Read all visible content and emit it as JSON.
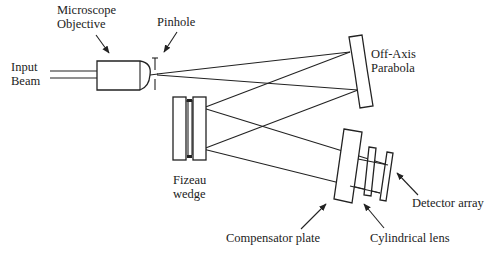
{
  "diagram": {
    "type": "optical-schematic",
    "labels": {
      "input_beam": [
        "Input",
        "Beam"
      ],
      "microscope_objective": [
        "Microscope",
        "Objective"
      ],
      "pinhole": "Pinhole",
      "off_axis_parabola": [
        "Off-Axis",
        "Parabola"
      ],
      "fizeau_wedge": [
        "Fizeau",
        "wedge"
      ],
      "compensator_plate": "Compensator plate",
      "cylindrical_lens": "Cylindrical lens",
      "detector_array": "Detector array"
    },
    "components": [
      {
        "id": "input-beam",
        "name": "Input Beam"
      },
      {
        "id": "microscope-objective",
        "name": "Microscope Objective"
      },
      {
        "id": "pinhole",
        "name": "Pinhole"
      },
      {
        "id": "off-axis-parabola",
        "name": "Off-Axis Parabola"
      },
      {
        "id": "fizeau-wedge",
        "name": "Fizeau wedge"
      },
      {
        "id": "compensator-plate",
        "name": "Compensator plate"
      },
      {
        "id": "cylindrical-lens",
        "name": "Cylindrical lens"
      },
      {
        "id": "detector-array",
        "name": "Detector array"
      }
    ],
    "colors": {
      "ink": "#222222",
      "background": "#ffffff"
    }
  }
}
